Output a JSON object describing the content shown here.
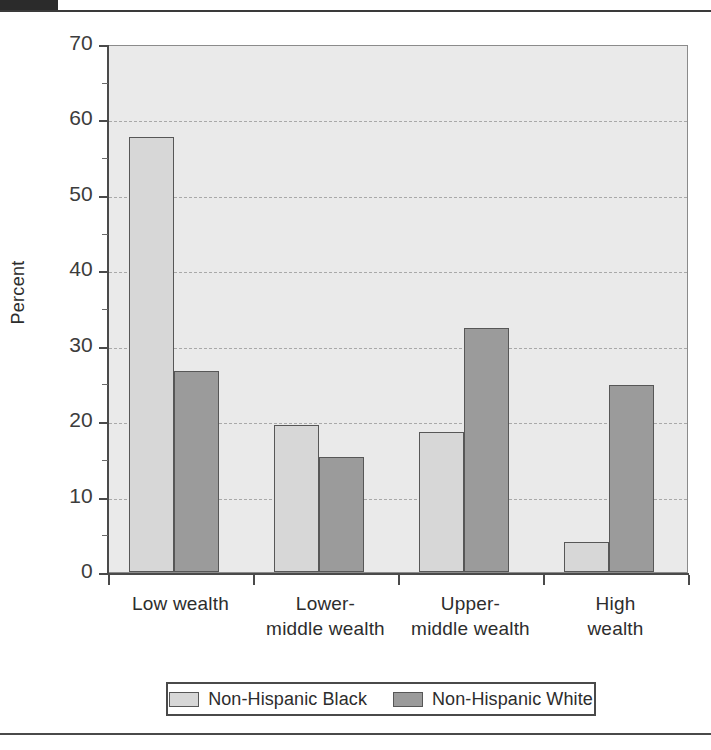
{
  "figure": {
    "top_block_label": "",
    "y_axis_title": "Percent"
  },
  "chart_data": {
    "type": "bar",
    "title": "",
    "xlabel": "",
    "ylabel": "Percent",
    "ylim": [
      0,
      70
    ],
    "ytick_step": 10,
    "ytick_labels": [
      "70",
      "60",
      "50",
      "40",
      "30",
      "20",
      "10",
      "0"
    ],
    "ytick_values": [
      70,
      60,
      50,
      40,
      30,
      20,
      10,
      0
    ],
    "grid": "horizontal-dashed",
    "legend_position": "bottom",
    "categories": [
      "Low wealth",
      "Lower-\nmiddle wealth",
      "Upper-\nmiddle wealth",
      "High\nwealth"
    ],
    "category_lines": [
      [
        "Low wealth"
      ],
      [
        "Lower-",
        "middle wealth"
      ],
      [
        "Upper-",
        "middle wealth"
      ],
      [
        "High",
        "wealth"
      ]
    ],
    "series": [
      {
        "name": "Non-Hispanic Black",
        "color": "#d7d7d7",
        "values": [
          57.7,
          19.5,
          18.5,
          4.0
        ]
      },
      {
        "name": "Non-Hispanic White",
        "color": "#9b9b9b",
        "values": [
          26.7,
          15.3,
          32.3,
          24.8
        ]
      }
    ]
  },
  "legend": {
    "entries": [
      {
        "label": "Non-Hispanic Black",
        "swatch": "light"
      },
      {
        "label": "Non-Hispanic White",
        "swatch": "dark"
      }
    ]
  }
}
